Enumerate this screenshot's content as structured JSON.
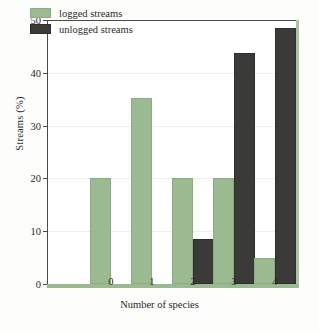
{
  "chart_data": {
    "type": "bar",
    "title": "",
    "xlabel": "Number of species",
    "ylabel": "Streams (%)",
    "categories": [
      "0",
      "1",
      "2",
      "3",
      "4"
    ],
    "series": [
      {
        "name": "logged streams",
        "color": "#9cba92",
        "values": [
          20,
          35.3,
          20,
          20,
          5
        ]
      },
      {
        "name": "unlogged streams",
        "color": "#3a3a38",
        "values": [
          0,
          0,
          8.6,
          43.8,
          48.5
        ]
      }
    ],
    "ylim": [
      0,
      50
    ],
    "yticks": [
      0,
      10,
      20,
      30,
      40,
      50
    ],
    "ytick_labels": [
      "0",
      "10",
      "20",
      "30",
      "40",
      "50"
    ],
    "grid": "horizontal",
    "legend_position": "top-left"
  },
  "axes": {
    "y_title": "Streams (%)",
    "x_title": "Number of species",
    "y_labels": [
      "50",
      "40",
      "30",
      "20",
      "10",
      "0"
    ],
    "x_labels": [
      "0",
      "1",
      "2",
      "3",
      "4"
    ]
  },
  "legend": {
    "items": [
      {
        "label": "logged streams"
      },
      {
        "label": "unlogged streams"
      }
    ]
  },
  "colors": {
    "logged": "#9cba92",
    "unlogged": "#3a3a38",
    "frame": "#4a4a46",
    "grid": "#efefe9"
  }
}
